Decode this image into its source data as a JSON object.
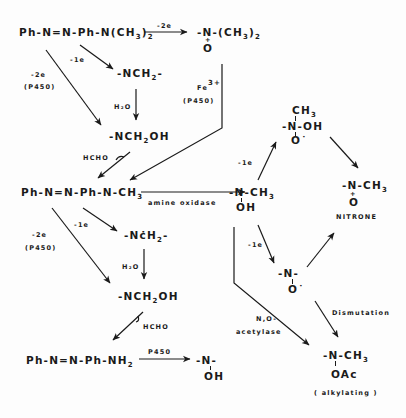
{
  "diagram": {
    "type": "metabolic-pathway",
    "nodes": {
      "dab": {
        "pre": "Ph-N=N-Ph-N(CH",
        "sub": "3",
        "post": ")",
        "sub2": "2"
      },
      "n_oxide": {
        "top": "-N-(CH",
        "top_sub": "3",
        "top_post": ")",
        "top_sub2": "2",
        "plus": "+",
        "bottom": "O"
      },
      "radical_ch2_top": {
        "text": "-NCH",
        "sub": "2",
        "post": "-"
      },
      "carbinolamine_top": {
        "text": "-NCH",
        "sub": "2",
        "post": "OH"
      },
      "mab": {
        "pre": "Ph-N=N-Ph-N-CH",
        "sub": "3"
      },
      "hydroxylamine": {
        "top": "-N-CH",
        "sub": "3",
        "bottom": "OH"
      },
      "nitroxide_oh": {
        "top": "CH",
        "top_sub": "3",
        "mid": "-N-OH",
        "bottom": "O˙"
      },
      "nitrone": {
        "top": "-N-CH",
        "sub": "3",
        "plus": "+",
        "bottom": "O",
        "label": "NITRONE"
      },
      "radical_ch2_mid": {
        "text": "-NċH",
        "sub": "2",
        "post": "-"
      },
      "nitroxide": {
        "top": "-N-",
        "bottom": "O˙"
      },
      "carbinolamine_mid": {
        "text": "-NCH",
        "sub": "2",
        "post": "OH"
      },
      "acetoxy": {
        "top": "-N-CH",
        "sub": "3",
        "bottom": "OAc",
        "label": "( alkylating )"
      },
      "ab": {
        "pre": "Ph-N=N-Ph-NH",
        "sub": "2"
      },
      "ab_hydroxylamine": {
        "top": "-N-",
        "bottom": "OH"
      }
    },
    "edge_labels": {
      "dab_to_noxide": "-2e",
      "dab_to_radical": "-1e",
      "dab_to_carbinol_1": "-2e",
      "dab_to_carbinol_2": "(P450)",
      "radical_h2o": "H₂O",
      "carbinol_hcho": "HCHO",
      "fe_1": "Fe",
      "fe_sup": "3+",
      "fe_2": "(P450)",
      "amine_oxidase": "amine oxidase",
      "mab_to_radical": "-1e",
      "mab_to_carbinol_1": "-2e",
      "mab_to_carbinol_2": "(P450)",
      "radical_mid_h2o": "H₂O",
      "carbinol_mid_hcho": "HCHO",
      "ab_p450": "P450",
      "hydroxyl_to_nitroxide_oh": "-1e",
      "hydroxyl_to_nitroxide": "-1e",
      "acetylase_1": "N,O-",
      "acetylase_2": "acetylase",
      "dismutation": "Dismutation"
    }
  }
}
